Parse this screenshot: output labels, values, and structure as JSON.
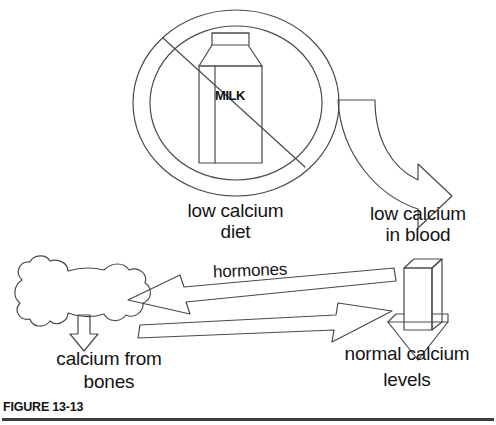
{
  "figure": {
    "caption": "FIGURE 13-13",
    "title_text": "low calcium diet regulation loop"
  },
  "nodes": {
    "low_calcium_diet": {
      "label": "low calcium\ndiet",
      "icon": "no-milk-icon"
    },
    "low_calcium_in_blood": {
      "label": "low calcium\nin blood"
    },
    "calcium_from_bones": {
      "label": "calcium from\nbones",
      "icon": "bone-icon"
    },
    "normal_calcium_levels": {
      "label": "normal calcium\nlevels",
      "icon": "block-down-arrow-icon"
    }
  },
  "milk_carton": {
    "brand_text": "MILK"
  },
  "connectors": {
    "curved_arrow": {
      "name": "curved-down-right-arrow",
      "from": "low_calcium_diet",
      "to": "low_calcium_in_blood"
    },
    "hormones_arrow": {
      "label": "hormones",
      "from": "low_calcium_in_blood",
      "to": "calcium_from_bones",
      "direction": "left"
    },
    "return_arrow": {
      "label": "",
      "from": "calcium_from_bones",
      "to": "normal_calcium_levels",
      "direction": "right"
    },
    "bone_down_arrow": {
      "name": "small-down-arrow",
      "from": "calcium_from_bones"
    },
    "levels_down_arrow": {
      "name": "block-down-arrow",
      "from": "normal_calcium_levels"
    }
  },
  "colors": {
    "ink": "#1a1a1a",
    "stroke": "#4a4a4a",
    "background": "#ffffff",
    "rule": "#3c3c3c"
  }
}
